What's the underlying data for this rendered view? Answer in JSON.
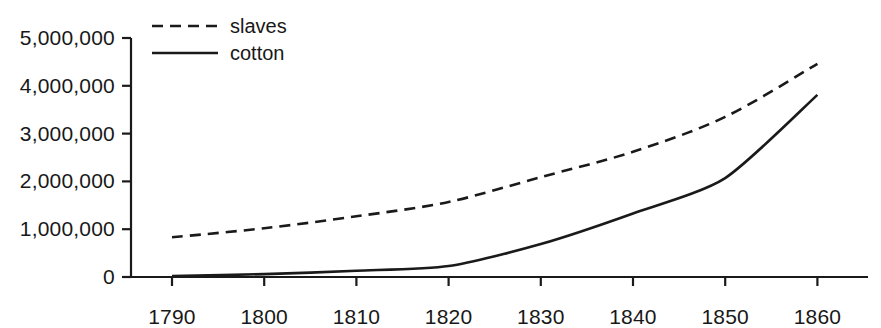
{
  "chart_data": {
    "type": "line",
    "title": "",
    "subtitle": "",
    "xlabel": "",
    "ylabel": "",
    "x": [
      1790,
      1800,
      1810,
      1820,
      1830,
      1840,
      1850,
      1860
    ],
    "categories": [
      "1790",
      "1800",
      "1810",
      "1820",
      "1830",
      "1840",
      "1850",
      "1860"
    ],
    "series": [
      {
        "name": "slaves",
        "style": "dashed",
        "color": "#1a1a1a",
        "values": [
          830000,
          1020000,
          1270000,
          1570000,
          2090000,
          2620000,
          3350000,
          4460000
        ]
      },
      {
        "name": "cotton",
        "style": "solid",
        "color": "#1a1a1a",
        "values": [
          20000,
          60000,
          130000,
          230000,
          690000,
          1330000,
          2070000,
          3810000
        ]
      }
    ],
    "xlim": [
      1785,
      1863
    ],
    "ylim": [
      0,
      5000000
    ],
    "ytick_values": [
      0,
      1000000,
      2000000,
      3000000,
      4000000,
      5000000
    ],
    "ytick_labels": [
      "0",
      "1,000,000",
      "2,000,000",
      "3,000,000",
      "4,000,000",
      "5,000,000"
    ],
    "xtick_values": [
      1790,
      1800,
      1810,
      1820,
      1830,
      1840,
      1850,
      1860
    ],
    "xtick_labels": [
      "1790",
      "1800",
      "1810",
      "1820",
      "1830",
      "1840",
      "1850",
      "1860"
    ],
    "grid": false,
    "legend": {
      "position": "top-left-inside",
      "entries": [
        {
          "label": "slaves",
          "style": "dashed"
        },
        {
          "label": "cotton",
          "style": "solid"
        }
      ]
    },
    "axis_color": "#1a1a1a",
    "background_color": "#ffffff"
  }
}
